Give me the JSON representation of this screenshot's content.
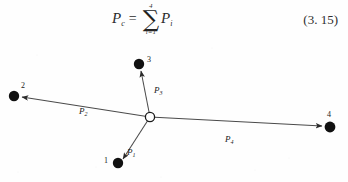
{
  "equation": {
    "lhs_symbol": "P",
    "lhs_subscript": "c",
    "equals": "=",
    "sigma_glyph": "∑",
    "sigma_upper_limit": "4",
    "sigma_lower_limit": "i=1",
    "rhs_symbol": "P",
    "rhs_subscript": "i",
    "number": "(3. 15)"
  },
  "diagram": {
    "center_node": {
      "name": "origin-node",
      "style": "hollow-circle",
      "x": 150,
      "y": 83
    },
    "nodes": [
      {
        "id": "1",
        "label": "1",
        "x": 118,
        "y": 129,
        "label_x": 104,
        "label_y": 127,
        "style": "filled-dot"
      },
      {
        "id": "2",
        "label": "2",
        "x": 14,
        "y": 62,
        "label_x": 20,
        "label_y": 50,
        "style": "filled-dot"
      },
      {
        "id": "3",
        "label": "3",
        "x": 139,
        "y": 30,
        "label_x": 148,
        "label_y": 24,
        "style": "filled-dot"
      },
      {
        "id": "4",
        "label": "4",
        "x": 330,
        "y": 93,
        "label_x": 326,
        "label_y": 79,
        "style": "filled-dot"
      }
    ],
    "vectors": [
      {
        "id": "P1",
        "symbol": "P",
        "subscript": "1",
        "label_x": 128,
        "label_y": 118,
        "from": "center",
        "to": "1"
      },
      {
        "id": "P2",
        "symbol": "P",
        "subscript": "2",
        "label_x": 80,
        "label_y": 77,
        "from": "center",
        "to": "2"
      },
      {
        "id": "P3",
        "symbol": "P",
        "subscript": "3",
        "label_x": 155,
        "label_y": 56,
        "from": "center",
        "to": "3"
      },
      {
        "id": "P4",
        "symbol": "P",
        "subscript": "4",
        "label_x": 226,
        "label_y": 105,
        "from": "center",
        "to": "4"
      }
    ],
    "colors": {
      "ink": "#141414",
      "line": "#4a4a4a",
      "background": "#fefefe"
    }
  }
}
